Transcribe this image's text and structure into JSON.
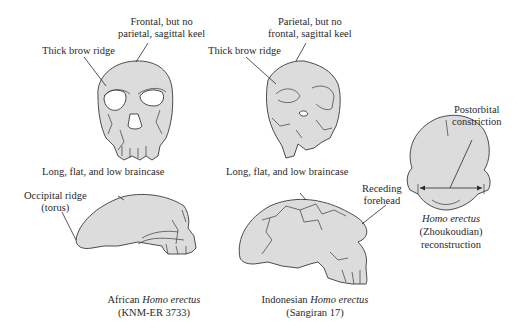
{
  "diagram": {
    "colors": {
      "bone_fill": "#dcdcdc",
      "outline": "#3a3a3a",
      "text": "#2a2a2a",
      "background": "#ffffff"
    },
    "panels": [
      {
        "id": "african",
        "labels": {
          "top_keel": [
            "Frontal, but no",
            "parietal, sagittal keel"
          ],
          "brow": "Thick brow ridge",
          "braincase": "Long, flat, and low braincase",
          "occipital": [
            "Occipital ridge",
            "(torus)"
          ]
        },
        "caption": {
          "prefix": "African ",
          "species": "Homo erectus",
          "specimen": "(KNM-ER 3733)"
        }
      },
      {
        "id": "indonesian",
        "labels": {
          "top_keel": [
            "Parietal, but no",
            "frontal, sagittal keel"
          ],
          "brow": "Thick brow ridge",
          "braincase": "Long, flat, and low braincase",
          "forehead": [
            "Receding",
            "forehead"
          ]
        },
        "caption": {
          "prefix": "Indonesian ",
          "species": "Homo erectus",
          "specimen": "(Sangiran 17)"
        }
      },
      {
        "id": "zhoukoudian",
        "labels": {
          "constriction": [
            "Postorbital",
            "constriction"
          ]
        },
        "caption": {
          "species": "Homo erectus",
          "line2": "(Zhoukoudian)",
          "line3": "reconstruction"
        }
      }
    ]
  }
}
